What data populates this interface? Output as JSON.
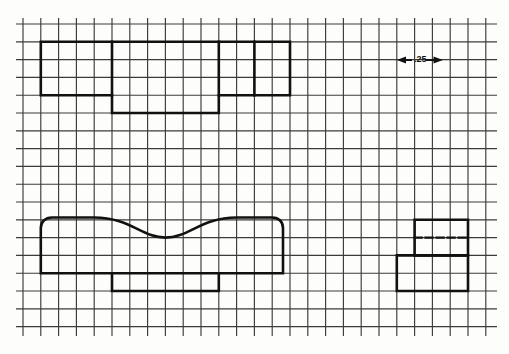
{
  "drawing": {
    "title": "graph-paper-profile-drawing",
    "medium": "scanned engineering grid paper",
    "paper_color": "#fdfdfb",
    "grid_color": "#2b2b2b",
    "object_line_color": "#111111",
    "annotation": {
      "dimension_text": ".25",
      "dimension_meaning": "grid square size in inches",
      "arrow_left": "left-arrow-icon",
      "arrow_right": "right-arrow-icon",
      "x": 399,
      "y": 57
    },
    "grid": {
      "cell_size": 17.8,
      "origin_x": 23,
      "origin_y": 25,
      "columns": 27,
      "rows": 18,
      "line_width": 1.1,
      "visible": true
    },
    "shapes": [
      {
        "name": "top-stepped-profile",
        "style": "solid",
        "points": "48,58 48,111 119,111 119,129 227,129 227,111 262,111 262,111 298,111 298,58 48,58",
        "description": "stepped rectangular outline upper-left",
        "path": "M48,58 L298,58 L298,111 L227,111 L227,129 L119,129 L119,111 L48,111 Z"
      },
      {
        "name": "top-profile-internal-divider",
        "style": "solid",
        "path": "M119,58 L119,111",
        "description": "vertical internal edge line"
      },
      {
        "name": "top-profile-internal-divider-2",
        "style": "solid",
        "path": "M227,58 L227,111",
        "description": "second vertical internal edge line"
      },
      {
        "name": "top-profile-right-divider",
        "style": "solid",
        "path": "M262,58 L262,111",
        "description": "right vertical internal edge line"
      },
      {
        "name": "bottom-left-curved-profile",
        "style": "solid",
        "description": "curved top profile with rounded ends and flat base",
        "path": "M48,271 L48,233 C48,219 55,214 66,214 L100,214 C140,214 150,240 166,240 C183,240 192,214 232,214 L264,214 C276,214 281,220 281,233 L281,271 Z"
      },
      {
        "name": "bottom-left-tab",
        "style": "solid",
        "description": "rectangular tab below baseline",
        "path": "M119,271 L119,289 L227,289 L227,271"
      },
      {
        "name": "right-step-profile-upper",
        "style": "solid",
        "description": "upper rectangle of L-shaped step block",
        "path": "M416,215 L470,215 L470,268 L416,268 Z"
      },
      {
        "name": "right-step-profile-lower",
        "style": "solid",
        "description": "lower rectangle of L-shaped step block",
        "path": "M398,251 L470,251 L470,287 L398,287 Z"
      },
      {
        "name": "right-step-hidden-line",
        "style": "dashed",
        "description": "hidden edge dashed line inside step block",
        "path": "M416,233 L470,233"
      }
    ]
  }
}
